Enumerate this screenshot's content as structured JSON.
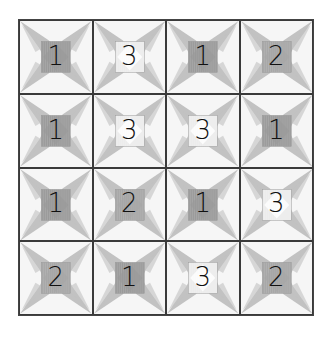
{
  "puzzle": {
    "rows": 4,
    "cols": 4,
    "grid": [
      [
        1,
        3,
        1,
        2
      ],
      [
        1,
        3,
        3,
        1
      ],
      [
        1,
        2,
        1,
        3
      ],
      [
        2,
        1,
        3,
        2
      ]
    ],
    "tile_shades": {
      "1": "#9a9a9a",
      "2": "#a6a6a6",
      "3": "#ececec"
    },
    "petal_color": "#b9b9b9",
    "grid_line_color": "#3a3a3a"
  },
  "cells": [
    {
      "label": "1"
    },
    {
      "label": "3"
    },
    {
      "label": "1"
    },
    {
      "label": "2"
    },
    {
      "label": "1"
    },
    {
      "label": "3"
    },
    {
      "label": "3"
    },
    {
      "label": "1"
    },
    {
      "label": "1"
    },
    {
      "label": "2"
    },
    {
      "label": "1"
    },
    {
      "label": "3"
    },
    {
      "label": "2"
    },
    {
      "label": "1"
    },
    {
      "label": "3"
    },
    {
      "label": "2"
    }
  ]
}
